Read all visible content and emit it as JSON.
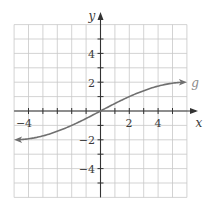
{
  "chart_data": {
    "type": "line",
    "title": "",
    "xlabel": "x",
    "ylabel": "y",
    "xlim": [
      -6,
      6
    ],
    "ylim": [
      -6,
      6
    ],
    "grid": true,
    "grid_step": 1,
    "x_ticks": [
      -4,
      2,
      4
    ],
    "y_ticks": [
      4,
      2,
      -2,
      -4
    ],
    "x_tick_labels": [
      "−4",
      "2",
      "4"
    ],
    "y_tick_labels": [
      "4",
      "2",
      "−2",
      "−4"
    ],
    "series": [
      {
        "name": "g",
        "label": "g",
        "arrows": "both",
        "x": [
          -6,
          -5,
          -4,
          -3,
          -2,
          -1,
          0,
          1,
          2,
          3,
          4,
          5,
          6
        ],
        "values": [
          -2.0,
          -1.93,
          -1.73,
          -1.41,
          -1.0,
          -0.52,
          0,
          0.52,
          1.0,
          1.41,
          1.73,
          1.93,
          2.0
        ]
      }
    ],
    "colors": {
      "grid": "#c8c8c8",
      "axis": "#333333",
      "curve": "#707070",
      "border": "#c8c8c8"
    }
  },
  "labels": {
    "x_axis": "x",
    "y_axis": "y",
    "curve": "g",
    "tick_x_neg4": "−4",
    "tick_x_2": "2",
    "tick_x_4": "4",
    "tick_y_4": "4",
    "tick_y_2": "2",
    "tick_y_neg2": "−2",
    "tick_y_neg4": "−4"
  }
}
